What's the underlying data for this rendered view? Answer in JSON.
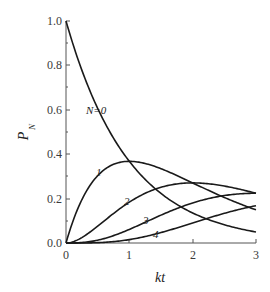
{
  "chart_data": {
    "type": "line",
    "title": "",
    "xlabel": "kt",
    "ylabel": "P_N",
    "ylabel_main": "P",
    "ylabel_sub": "N",
    "xlim": [
      0,
      3
    ],
    "ylim": [
      0,
      1.0
    ],
    "x_ticks": [
      "0",
      "1",
      "2",
      "3"
    ],
    "y_ticks": [
      "0.0",
      "0.2",
      "0.4",
      "0.6",
      "0.8",
      "1.0"
    ],
    "grid": false,
    "legend": "inline curve labels",
    "x": [
      0,
      0.25,
      0.5,
      0.75,
      1.0,
      1.25,
      1.5,
      1.75,
      2.0,
      2.25,
      2.5,
      2.75,
      3.0
    ],
    "series": [
      {
        "name": "N=0",
        "label": "N=0",
        "values": [
          1.0,
          0.779,
          0.607,
          0.472,
          0.368,
          0.287,
          0.223,
          0.174,
          0.135,
          0.105,
          0.082,
          0.064,
          0.05
        ]
      },
      {
        "name": "N=1",
        "label": "1",
        "values": [
          0.0,
          0.195,
          0.303,
          0.354,
          0.368,
          0.358,
          0.335,
          0.304,
          0.271,
          0.237,
          0.205,
          0.175,
          0.149
        ]
      },
      {
        "name": "N=2",
        "label": "2",
        "values": [
          0.0,
          0.024,
          0.076,
          0.133,
          0.184,
          0.224,
          0.251,
          0.266,
          0.271,
          0.267,
          0.257,
          0.241,
          0.224
        ]
      },
      {
        "name": "N=3",
        "label": "3",
        "values": [
          0.0,
          0.002,
          0.013,
          0.033,
          0.061,
          0.093,
          0.126,
          0.155,
          0.18,
          0.2,
          0.214,
          0.221,
          0.224
        ]
      },
      {
        "name": "N=4",
        "label": "4",
        "values": [
          0.0,
          0.0,
          0.002,
          0.006,
          0.015,
          0.029,
          0.047,
          0.068,
          0.09,
          0.113,
          0.134,
          0.152,
          0.168
        ]
      }
    ]
  },
  "labels": {
    "curve0": "N=0",
    "curve1": "1",
    "curve2": "2",
    "curve3": "3",
    "curve4": "4",
    "xlabel": "kt",
    "ylabel_main": "P",
    "ylabel_sub": "N",
    "xticks": [
      "0",
      "1",
      "2",
      "3"
    ],
    "yticks": [
      "0.0",
      "0.2",
      "0.4",
      "0.6",
      "0.8",
      "1.0"
    ]
  }
}
